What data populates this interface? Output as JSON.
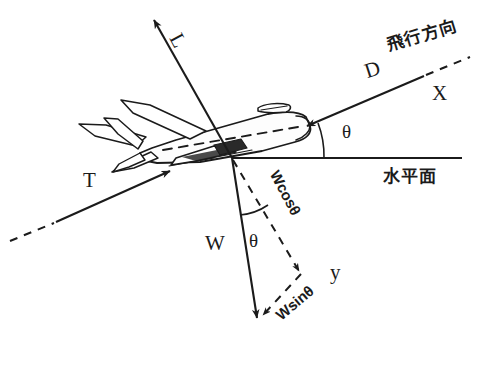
{
  "diagram": {
    "stroke_color": "#1b1b1b",
    "background": "#ffffff",
    "width": 486,
    "height": 373
  },
  "labels": {
    "lift": "L",
    "drag": "D",
    "thrust": "T",
    "weight": "W",
    "x_axis": "X",
    "y_axis": "y",
    "theta_upper": "θ",
    "theta_lower": "θ",
    "w_cos_theta": "Wcosθ",
    "w_sin_theta": "Wsinθ",
    "flight_direction": "飛行方向",
    "horizontal_plane": "水平面"
  },
  "geometry": {
    "origin": {
      "x": 232,
      "y": 158
    },
    "lift_arrow": {
      "x1": 232,
      "y1": 158,
      "x2": 153,
      "y2": 18
    },
    "drag_arrow": {
      "x1": 424,
      "y1": 76,
      "x2": 307,
      "y2": 126
    },
    "flight_dash": {
      "x1": 424,
      "y1": 76,
      "x2": 468,
      "y2": 58
    },
    "thrust_arrow": {
      "x1": 55,
      "y1": 222,
      "x2": 168,
      "y2": 172
    },
    "thrust_dash": {
      "x1": 12,
      "y1": 240,
      "x2": 55,
      "y2": 222
    },
    "weight_arrow": {
      "x1": 232,
      "y1": 158,
      "x2": 258,
      "y2": 320
    },
    "wcos_dash": {
      "x1": 232,
      "y1": 158,
      "x2": 300,
      "y2": 272
    },
    "wsin_dash": {
      "x1": 300,
      "y1": 272,
      "x2": 262,
      "y2": 318
    },
    "horizon_line": {
      "x1": 232,
      "y1": 158,
      "x2": 462,
      "y2": 158
    },
    "theta_upper_arc": {
      "cx": 232,
      "cy": 158,
      "r": 92
    },
    "theta_lower_arc": {
      "cx": 232,
      "cy": 158,
      "r": 58
    }
  }
}
